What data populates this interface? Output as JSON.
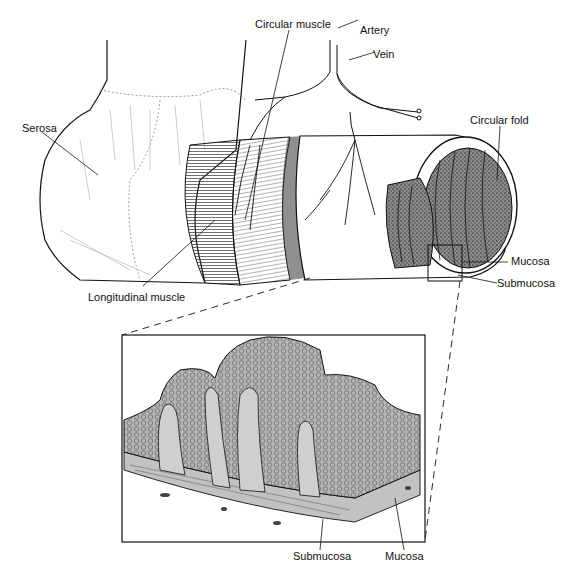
{
  "diagram": {
    "upper_labels": {
      "serosa": "Serosa",
      "circular_muscle": "Circular muscle",
      "artery": "Artery",
      "vein": "Vein",
      "circular_fold": "Circular fold",
      "mucosa": "Mucosa",
      "submucosa": "Submucosa",
      "longitudinal_muscle": "Longitudinal muscle"
    },
    "inset_labels": {
      "submucosa": "Submucosa",
      "mucosa": "Mucosa"
    },
    "colors": {
      "line": "#111111",
      "tissue_fill": "#b8b8b8",
      "tissue_dark": "#6e6e6e",
      "background": "#ffffff"
    }
  }
}
